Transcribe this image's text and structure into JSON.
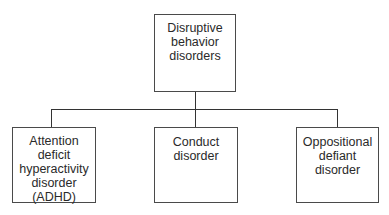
{
  "diagram": {
    "type": "hierarchy",
    "root": {
      "label_lines": [
        "Disruptive",
        "behavior",
        "disorders"
      ]
    },
    "children": [
      {
        "label_lines": [
          "Attention",
          "deficit",
          "hyperactivity",
          "disorder",
          "(ADHD)"
        ]
      },
      {
        "label_lines": [
          "Conduct",
          "disorder"
        ]
      },
      {
        "label_lines": [
          "Oppositional",
          "defiant",
          "disorder"
        ]
      }
    ],
    "colors": {
      "border": "#4a4a4a",
      "line": "#333333",
      "text": "#2a2a2a",
      "background": "#ffffff"
    }
  }
}
